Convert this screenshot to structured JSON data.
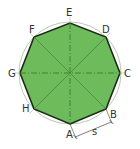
{
  "diagram": {
    "colors": {
      "fill": "#6dbb5a",
      "outline": "#1e2a18",
      "circle": "#b9c9b0",
      "axis": "#3d7a2e",
      "label": "#333333",
      "dimension": "#444444"
    },
    "center": [
      70,
      73
    ],
    "radius": 51,
    "vertices": [
      {
        "name": "A",
        "x": 70,
        "y": 124,
        "label_x": 66,
        "label_y": 138
      },
      {
        "name": "B",
        "x": 106,
        "y": 109,
        "label_x": 110,
        "label_y": 118
      },
      {
        "name": "C",
        "x": 120,
        "y": 73,
        "label_x": 124,
        "label_y": 77
      },
      {
        "name": "D",
        "x": 106,
        "y": 37,
        "label_x": 102,
        "label_y": 33
      },
      {
        "name": "E",
        "x": 70,
        "y": 23,
        "label_x": 66,
        "label_y": 16
      },
      {
        "name": "F",
        "x": 34,
        "y": 37,
        "label_x": 29,
        "label_y": 33
      },
      {
        "name": "G",
        "x": 20,
        "y": 73,
        "label_x": 8,
        "label_y": 77
      },
      {
        "name": "H",
        "x": 34,
        "y": 109,
        "label_x": 22,
        "label_y": 112
      }
    ],
    "dimension": {
      "label": "s",
      "from": "A",
      "to": "B"
    }
  }
}
